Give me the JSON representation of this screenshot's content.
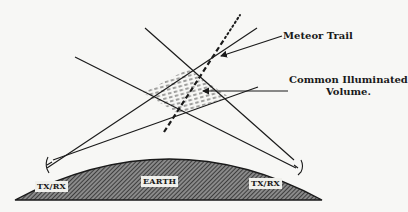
{
  "diagram": {
    "type": "meteor-scatter-propagation",
    "labels": {
      "meteor_trail": "Meteor Trail",
      "common_volume_line1": "Common Illuminated",
      "common_volume_line2": "Volume."
    },
    "stations": {
      "left": "TX/RX",
      "right": "TX/RX"
    },
    "earth_label": "EARTH",
    "colors": {
      "background": "#f7f7f5",
      "line": "#1a1a1a",
      "earth_fill": "#555555"
    }
  }
}
